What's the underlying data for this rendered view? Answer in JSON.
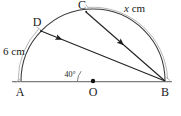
{
  "figure": {
    "points": {
      "A": {
        "label": "A",
        "x": 20,
        "y": 81
      },
      "B": {
        "label": "B",
        "x": 165,
        "y": 81
      },
      "O": {
        "label": "O",
        "x": 93,
        "y": 81
      },
      "C": {
        "label": "C",
        "x": 86,
        "y": 11
      },
      "D": {
        "label": "D",
        "x": 41,
        "y": 31
      }
    },
    "measurements": {
      "arc_AD": {
        "value": "6 cm",
        "unit": "cm",
        "number": "6"
      },
      "arc_CB": {
        "value_italic": "x",
        "value_rest": " cm",
        "unit": "cm"
      },
      "angle_at_O": {
        "value": "40°",
        "degrees": "40"
      }
    },
    "colors": {
      "stroke": "#2b2b2b",
      "measure_arc": "#9a9a9a",
      "baseline": "#7d7d7d",
      "label_text": "#1a1a1a",
      "background": "#ffffff"
    },
    "geometry": {
      "center_x": 93,
      "center_y": 81,
      "radius": 72
    }
  }
}
